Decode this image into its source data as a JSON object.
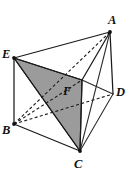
{
  "figure": {
    "kind": "geometry-diagram",
    "background_color": "#ffffff",
    "line_color": "#1a1a1a",
    "shade_color": "#9b9b9b",
    "width": 129,
    "height": 177,
    "labels": [
      {
        "id": "A",
        "text": "A",
        "x": 108,
        "y": 14
      },
      {
        "id": "E",
        "text": "E",
        "x": 2,
        "y": 48
      },
      {
        "id": "D",
        "text": "D",
        "x": 116,
        "y": 86
      },
      {
        "id": "F",
        "text": "F",
        "x": 63,
        "y": 85
      },
      {
        "id": "B",
        "text": "B",
        "x": 2,
        "y": 124
      },
      {
        "id": "C",
        "text": "C",
        "x": 74,
        "y": 158
      }
    ],
    "vertices": [
      {
        "id": "A",
        "x": 110,
        "y": 32
      },
      {
        "id": "E",
        "x": 14,
        "y": 58
      },
      {
        "id": "F",
        "x": 82,
        "y": 80
      },
      {
        "id": "D",
        "x": 113,
        "y": 94
      },
      {
        "id": "B",
        "x": 14,
        "y": 124
      },
      {
        "id": "C",
        "x": 80,
        "y": 151
      }
    ],
    "shaded_faces": [
      {
        "name": "triangle-EFC",
        "points": "14,58 82,80 80,151"
      },
      {
        "name": "triangle-EFC-upper",
        "points": "14,58 82,80 46,108"
      }
    ],
    "solid_edges": [
      {
        "name": "edge-E-A",
        "x1": 14,
        "y1": 58,
        "x2": 110,
        "y2": 32
      },
      {
        "name": "edge-E-F",
        "x1": 14,
        "y1": 58,
        "x2": 82,
        "y2": 80
      },
      {
        "name": "edge-A-F",
        "x1": 110,
        "y1": 32,
        "x2": 82,
        "y2": 80
      },
      {
        "name": "edge-A-D",
        "x1": 110,
        "y1": 32,
        "x2": 113,
        "y2": 94
      },
      {
        "name": "edge-A-C",
        "x1": 110,
        "y1": 32,
        "x2": 80,
        "y2": 151
      },
      {
        "name": "edge-F-D",
        "x1": 82,
        "y1": 80,
        "x2": 113,
        "y2": 94
      },
      {
        "name": "edge-F-C",
        "x1": 82,
        "y1": 80,
        "x2": 80,
        "y2": 151
      },
      {
        "name": "edge-D-C",
        "x1": 113,
        "y1": 94,
        "x2": 80,
        "y2": 151
      },
      {
        "name": "edge-E-B",
        "x1": 14,
        "y1": 58,
        "x2": 14,
        "y2": 124
      },
      {
        "name": "edge-E-C",
        "x1": 14,
        "y1": 58,
        "x2": 80,
        "y2": 151
      },
      {
        "name": "edge-B-C",
        "x1": 14,
        "y1": 124,
        "x2": 80,
        "y2": 151
      }
    ],
    "dashed_edges": [
      {
        "name": "edge-B-A-hidden",
        "x1": 14,
        "y1": 124,
        "x2": 110,
        "y2": 32
      },
      {
        "name": "edge-B-D-hidden",
        "x1": 14,
        "y1": 124,
        "x2": 113,
        "y2": 94
      },
      {
        "name": "edge-B-F-hidden",
        "x1": 14,
        "y1": 124,
        "x2": 82,
        "y2": 80
      }
    ]
  }
}
